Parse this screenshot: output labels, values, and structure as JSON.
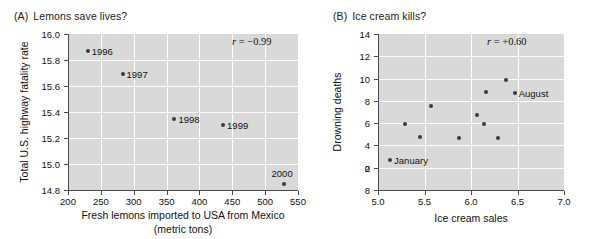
{
  "figure": {
    "panels": [
      {
        "tag": "(A)",
        "title": "Lemons save lives?",
        "annotation": "= −0.99",
        "annotation_symbol": "r"
      },
      {
        "tag": "(B)",
        "title": "Ice cream kills?",
        "annotation": "= +0.60",
        "annotation_symbol": "r"
      }
    ]
  },
  "chart_data": [
    {
      "type": "scatter",
      "panel": "A",
      "title": "Lemons save lives?",
      "xlabel": "Fresh lemons imported to USA from Mexico (metric tons)",
      "xlabel_line1": "Fresh lemons imported to USA from Mexico",
      "xlabel_line2": "(metric tons)",
      "ylabel": "Total U.S. highway fatality rate",
      "xlim": [
        200,
        550
      ],
      "ylim": [
        14.8,
        16.0
      ],
      "xticks": [
        200,
        250,
        300,
        350,
        400,
        450,
        500,
        550
      ],
      "xtick_labels": [
        "200",
        "250",
        "300",
        "350",
        "400",
        "450",
        "500",
        "550"
      ],
      "yticks": [
        14.8,
        15.0,
        15.2,
        15.4,
        15.6,
        15.8,
        16.0
      ],
      "ytick_labels": [
        "14.8",
        "15.0",
        "15.2",
        "15.4",
        "15.6",
        "15.8",
        "16.0"
      ],
      "grid": true,
      "legend": "none",
      "annotation": "r = −0.99",
      "correlation": -0.99,
      "points": [
        {
          "label": "1996",
          "x": 230,
          "y": 15.87,
          "label_side": "right"
        },
        {
          "label": "1997",
          "x": 283,
          "y": 15.69,
          "label_side": "right"
        },
        {
          "label": "1998",
          "x": 362,
          "y": 15.35,
          "label_side": "right"
        },
        {
          "label": "1999",
          "x": 436,
          "y": 15.3,
          "label_side": "right"
        },
        {
          "label": "2000",
          "x": 528,
          "y": 14.85,
          "label_side": "above"
        }
      ]
    },
    {
      "type": "scatter",
      "panel": "B",
      "title": "Ice cream kills?",
      "xlabel": "Ice cream sales",
      "ylabel": "Drowning deaths",
      "xlim": [
        5.0,
        7.0
      ],
      "ylim": [
        0,
        14
      ],
      "xticks": [
        5.0,
        5.5,
        6.0,
        6.5,
        7.0
      ],
      "xtick_labels": [
        "5.0",
        "5.5",
        "6.0",
        "6.5",
        "7.0"
      ],
      "yticks": [
        0,
        2,
        4,
        6,
        8,
        10,
        12,
        14
      ],
      "ytick_labels": [
        "0",
        "8",
        "2",
        "4",
        "6",
        "8",
        "10",
        "12",
        "14"
      ],
      "ytick_label_note": "As printed in the original figure the second tick from the bottom reads 8 instead of 2",
      "grid": true,
      "legend": "none",
      "annotation": "r = +0.60",
      "correlation": 0.6,
      "points": [
        {
          "label": "January",
          "x": 5.13,
          "y": 2.7,
          "label_side": "right"
        },
        {
          "label": "",
          "x": 5.29,
          "y": 5.9,
          "label_side": "none"
        },
        {
          "label": "",
          "x": 5.45,
          "y": 4.8,
          "label_side": "none"
        },
        {
          "label": "",
          "x": 5.57,
          "y": 7.5,
          "label_side": "none"
        },
        {
          "label": "",
          "x": 5.87,
          "y": 4.7,
          "label_side": "none"
        },
        {
          "label": "",
          "x": 6.06,
          "y": 6.7,
          "label_side": "none"
        },
        {
          "label": "",
          "x": 6.14,
          "y": 5.9,
          "label_side": "none"
        },
        {
          "label": "",
          "x": 6.16,
          "y": 8.8,
          "label_side": "none"
        },
        {
          "label": "",
          "x": 6.29,
          "y": 4.7,
          "label_side": "none"
        },
        {
          "label": "",
          "x": 6.38,
          "y": 9.9,
          "label_side": "none"
        },
        {
          "label": "August",
          "x": 6.47,
          "y": 8.7,
          "label_side": "right"
        }
      ]
    }
  ]
}
